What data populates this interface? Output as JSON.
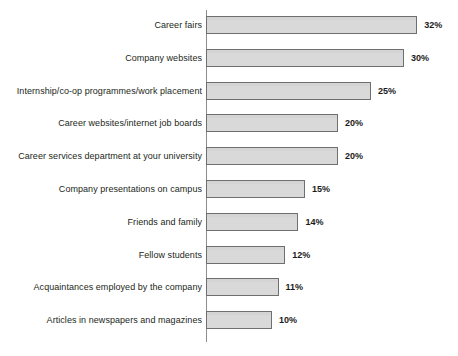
{
  "chart_data": {
    "type": "bar",
    "orientation": "horizontal",
    "title": "",
    "subtitle": "",
    "xlabel": "",
    "ylabel": "",
    "xlim": [
      0,
      32
    ],
    "grid": false,
    "legend": null,
    "value_suffix": "%",
    "categories": [
      "Career fairs",
      "Company websites",
      "Internship/co-op programmes/work placement",
      "Career websites/internet job boards",
      "Career services department at your university",
      "Company presentations on campus",
      "Friends and family",
      "Fellow students",
      "Acquaintances employed by the company",
      "Articles in newspapers and magazines"
    ],
    "values": [
      32,
      30,
      25,
      20,
      20,
      15,
      14,
      12,
      11,
      10
    ],
    "data_labels": [
      "32%",
      "30%",
      "25%",
      "20%",
      "20%",
      "15%",
      "14%",
      "12%",
      "11%",
      "10%"
    ],
    "colors": {
      "bar_fill": "#d9d9d9",
      "bar_border": "#6f6f6f",
      "axis": "#8d8d8d",
      "label_text": "#231f20",
      "value_text": "#1b1b1b",
      "background": "#ffffff"
    }
  }
}
